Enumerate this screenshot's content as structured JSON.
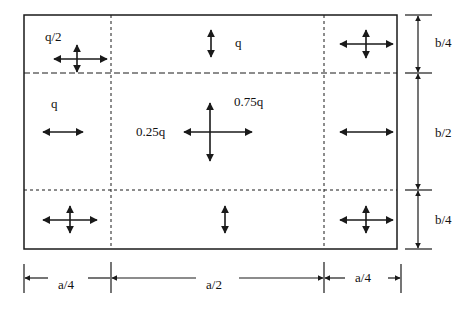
{
  "diagram": {
    "colors": {
      "line": "#1a1a1a",
      "text": "#111111",
      "background": "#ffffff"
    },
    "regions": {
      "top_left": {
        "label": "q/2",
        "arrows": "bidirectional-both"
      },
      "top_center": {
        "label": "q",
        "arrows": "vertical"
      },
      "top_right": {
        "label": "",
        "arrows": "bidirectional-both"
      },
      "middle_left": {
        "label": "q",
        "arrows": "horizontal"
      },
      "middle_center": {
        "label_left": "0.25q",
        "label_right": "0.75q",
        "arrows": "bidirectional-both"
      },
      "middle_right": {
        "label": "",
        "arrows": "horizontal"
      },
      "bottom_left": {
        "label": "",
        "arrows": "bidirectional-both"
      },
      "bottom_center": {
        "label": "",
        "arrows": "vertical"
      },
      "bottom_right": {
        "label": "",
        "arrows": "bidirectional-both"
      }
    },
    "dimensions": {
      "horizontal": [
        "a/4",
        "a/2",
        "a/4"
      ],
      "vertical": [
        "b/4",
        "b/2",
        "b/4"
      ]
    }
  }
}
